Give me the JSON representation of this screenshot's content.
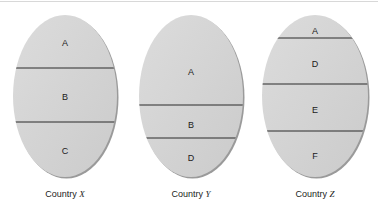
{
  "figure": {
    "panels": [
      {
        "id": "x",
        "caption_prefix": "Country ",
        "caption_var": "X",
        "oval": {
          "cx": 65,
          "cy": 96,
          "rx": 52,
          "ry": 81
        },
        "dividers": [
          68,
          122
        ],
        "segments": [
          {
            "label": "A",
            "y": 43
          },
          {
            "label": "B",
            "y": 97
          },
          {
            "label": "C",
            "y": 151
          }
        ]
      },
      {
        "id": "y",
        "caption_prefix": "Country ",
        "caption_var": "Y",
        "oval": {
          "cx": 191,
          "cy": 96,
          "rx": 52,
          "ry": 81
        },
        "dividers": [
          105,
          138
        ],
        "segments": [
          {
            "label": "A",
            "y": 72
          },
          {
            "label": "B",
            "y": 125
          },
          {
            "label": "D",
            "y": 158
          }
        ]
      },
      {
        "id": "z",
        "caption_prefix": "Country ",
        "caption_var": "Z",
        "oval": {
          "cx": 315,
          "cy": 96,
          "rx": 53,
          "ry": 81
        },
        "dividers": [
          38,
          84,
          131
        ],
        "segments": [
          {
            "label": "A",
            "y": 31
          },
          {
            "label": "D",
            "y": 64
          },
          {
            "label": "E",
            "y": 110
          },
          {
            "label": "F",
            "y": 156
          }
        ]
      }
    ],
    "colors": {
      "oval_fill": "#d4d4d4",
      "oval_shadow": "#9a9a9a",
      "divider": "#2a2a2a",
      "text": "#1a1a1a"
    }
  }
}
